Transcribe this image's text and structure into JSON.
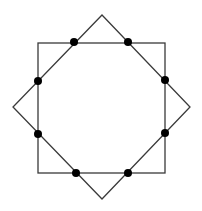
{
  "diagram": {
    "colors": {
      "background": "#ffffff",
      "stroke": "#3a3a3a",
      "dot": "#000000"
    },
    "stroke_width": 1.3,
    "dot_radius": 4,
    "square": {
      "x": 38,
      "y": 43,
      "width": 127,
      "height": 130
    },
    "diamond": {
      "points": [
        [
          102,
          15
        ],
        [
          190,
          107
        ],
        [
          102,
          199
        ],
        [
          13,
          107
        ]
      ]
    },
    "intersection_dots": [
      [
        74,
        42
      ],
      [
        128,
        42
      ],
      [
        165,
        80
      ],
      [
        165,
        133
      ],
      [
        128,
        173
      ],
      [
        76,
        173
      ],
      [
        38,
        134
      ],
      [
        38,
        81
      ]
    ]
  }
}
